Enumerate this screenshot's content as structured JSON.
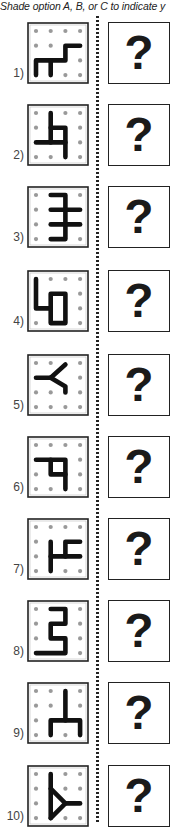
{
  "instruction": "Shade option A, B, or C to indicate y",
  "question_mark": "?",
  "grid_size": 4,
  "colors": {
    "stroke": "#111111",
    "dot": "#999999",
    "border": "#222222"
  },
  "problems": [
    {
      "label": "1)",
      "top": 22,
      "dots": [
        [
          0,
          0
        ],
        [
          1,
          0
        ],
        [
          2,
          0
        ],
        [
          3,
          0
        ],
        [
          0,
          1
        ],
        [
          1,
          1
        ],
        [
          3,
          2
        ],
        [
          2,
          3
        ],
        [
          3,
          3
        ]
      ],
      "paths": [
        [
          [
            0,
            3
          ],
          [
            0,
            2
          ],
          [
            2,
            2
          ],
          [
            2,
            1
          ],
          [
            3,
            1
          ]
        ],
        [
          [
            1,
            2
          ],
          [
            1,
            3
          ]
        ]
      ]
    },
    {
      "label": "2)",
      "top": 104,
      "dots": [
        [
          0,
          0
        ],
        [
          2,
          0
        ],
        [
          3,
          0
        ],
        [
          0,
          1
        ],
        [
          3,
          1
        ],
        [
          3,
          2
        ],
        [
          0,
          3
        ],
        [
          1,
          3
        ],
        [
          3,
          3
        ]
      ],
      "paths": [
        [
          [
            1,
            0
          ],
          [
            1,
            2
          ]
        ],
        [
          [
            0,
            2
          ],
          [
            2,
            2
          ]
        ],
        [
          [
            1,
            1
          ],
          [
            2,
            1
          ],
          [
            2,
            3
          ]
        ]
      ]
    },
    {
      "label": "3)",
      "top": 186,
      "dots": [
        [
          0,
          0
        ],
        [
          3,
          0
        ],
        [
          0,
          1
        ],
        [
          0,
          2
        ],
        [
          0,
          3
        ],
        [
          3,
          3
        ]
      ],
      "paths": [
        [
          [
            1,
            0
          ],
          [
            2,
            0
          ],
          [
            2,
            3
          ],
          [
            1,
            3
          ]
        ],
        [
          [
            1,
            1
          ],
          [
            3,
            1
          ]
        ],
        [
          [
            1,
            2
          ],
          [
            3,
            2
          ]
        ]
      ]
    },
    {
      "label": "4)",
      "top": 270,
      "dots": [
        [
          1,
          0
        ],
        [
          2,
          0
        ],
        [
          3,
          0
        ],
        [
          3,
          1
        ],
        [
          3,
          2
        ],
        [
          0,
          3
        ],
        [
          3,
          3
        ]
      ],
      "paths": [
        [
          [
            0,
            0
          ],
          [
            0,
            2
          ],
          [
            1,
            2
          ]
        ],
        [
          [
            1,
            1
          ],
          [
            2,
            1
          ],
          [
            2,
            3
          ],
          [
            1,
            3
          ],
          [
            1,
            1
          ]
        ]
      ]
    },
    {
      "label": "5)",
      "top": 354,
      "dots": [
        [
          0,
          0
        ],
        [
          1,
          0
        ],
        [
          3,
          0
        ],
        [
          3,
          1
        ],
        [
          0,
          2
        ],
        [
          1,
          2
        ],
        [
          3,
          2
        ],
        [
          0,
          3
        ],
        [
          1,
          3
        ],
        [
          2,
          3
        ],
        [
          3,
          3
        ]
      ],
      "paths": [
        [
          [
            0,
            1
          ],
          [
            1,
            1
          ],
          [
            2,
            0.1
          ]
        ],
        [
          [
            1,
            1
          ],
          [
            2,
            1.6
          ],
          [
            2,
            2
          ]
        ]
      ]
    },
    {
      "label": "6)",
      "top": 436,
      "dots": [
        [
          0,
          0
        ],
        [
          1,
          0
        ],
        [
          2,
          0
        ],
        [
          3,
          0
        ],
        [
          3,
          1
        ],
        [
          0,
          2
        ],
        [
          3,
          2
        ],
        [
          0,
          3
        ],
        [
          1,
          3
        ],
        [
          3,
          3
        ]
      ],
      "paths": [
        [
          [
            0,
            1
          ],
          [
            2,
            1
          ],
          [
            2,
            3
          ]
        ],
        [
          [
            1,
            1
          ],
          [
            1,
            2
          ],
          [
            2,
            2
          ]
        ]
      ]
    },
    {
      "label": "7)",
      "top": 518,
      "dots": [
        [
          0,
          0
        ],
        [
          1,
          0
        ],
        [
          2,
          0
        ],
        [
          3,
          0
        ],
        [
          0,
          1
        ],
        [
          0,
          2
        ],
        [
          0,
          3
        ],
        [
          2,
          3
        ],
        [
          3,
          3
        ]
      ],
      "paths": [
        [
          [
            1,
            1
          ],
          [
            1,
            3
          ]
        ],
        [
          [
            1,
            2
          ],
          [
            3,
            2
          ]
        ],
        [
          [
            2,
            2
          ],
          [
            2,
            1
          ],
          [
            3,
            1
          ]
        ]
      ]
    },
    {
      "label": "8)",
      "top": 600,
      "dots": [
        [
          0,
          0
        ],
        [
          3,
          0
        ],
        [
          0,
          1
        ],
        [
          3,
          1
        ],
        [
          0,
          2
        ],
        [
          3,
          2
        ],
        [
          3,
          3
        ]
      ],
      "paths": [
        [
          [
            1,
            0
          ],
          [
            2,
            0
          ],
          [
            2,
            1
          ],
          [
            1,
            1
          ],
          [
            1,
            2
          ],
          [
            2,
            2
          ],
          [
            2,
            3
          ],
          [
            0,
            3
          ]
        ]
      ]
    },
    {
      "label": "9)",
      "top": 682,
      "dots": [
        [
          0,
          0
        ],
        [
          1,
          0
        ],
        [
          3,
          0
        ],
        [
          0,
          1
        ],
        [
          1,
          1
        ],
        [
          3,
          1
        ],
        [
          0,
          2
        ],
        [
          0,
          3
        ],
        [
          2,
          3
        ]
      ],
      "paths": [
        [
          [
            2,
            0
          ],
          [
            2,
            2
          ]
        ],
        [
          [
            1,
            3
          ],
          [
            1,
            2
          ],
          [
            3,
            2
          ],
          [
            3,
            3
          ]
        ]
      ]
    },
    {
      "label": "10)",
      "top": 765,
      "dots": [
        [
          0,
          0
        ],
        [
          2,
          0
        ],
        [
          3,
          0
        ],
        [
          0,
          1
        ],
        [
          2,
          1
        ],
        [
          3,
          1
        ],
        [
          0,
          2
        ],
        [
          0,
          3
        ],
        [
          2,
          3
        ],
        [
          3,
          3
        ]
      ],
      "paths": [
        [
          [
            1,
            0
          ],
          [
            1,
            3
          ]
        ],
        [
          [
            1,
            1
          ],
          [
            2,
            2
          ],
          [
            1,
            3
          ]
        ],
        [
          [
            2,
            2
          ],
          [
            3,
            2
          ]
        ]
      ]
    }
  ]
}
